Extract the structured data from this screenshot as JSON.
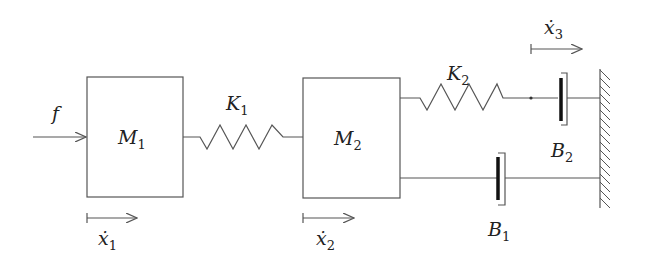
{
  "diagram": {
    "force": {
      "label": "f"
    },
    "masses": [
      {
        "label": "M",
        "sub": "1"
      },
      {
        "label": "M",
        "sub": "2"
      }
    ],
    "springs": [
      {
        "label": "K",
        "sub": "1"
      },
      {
        "label": "K",
        "sub": "2"
      }
    ],
    "dampers": [
      {
        "label": "B",
        "sub": "1"
      },
      {
        "label": "B",
        "sub": "2"
      }
    ],
    "velocities": [
      {
        "label": "ẋ",
        "sub": "1"
      },
      {
        "label": "ẋ",
        "sub": "2"
      },
      {
        "label": "ẋ",
        "sub": "3"
      }
    ],
    "colors": {
      "line": "#555555",
      "text": "#222222",
      "background": "#ffffff"
    }
  }
}
